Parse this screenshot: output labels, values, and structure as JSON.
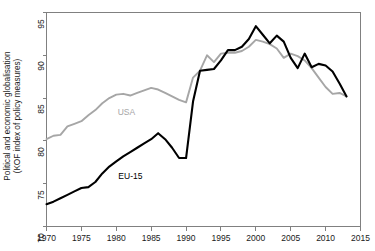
{
  "chart": {
    "ylabel_line1": "Political and economic globalisation",
    "ylabel_line2": "(KOF index of policy measures)",
    "ytick_labels": [
      "70",
      "75",
      "80",
      "85",
      "90",
      "95"
    ],
    "xtick_labels": [
      "1970",
      "1975",
      "1980",
      "1985",
      "1990",
      "1995",
      "2000",
      "2005",
      "2010",
      "2015"
    ],
    "series_label_usa": "USA",
    "series_label_eu": "EU-15",
    "color_usa": "#a6a6a6",
    "color_eu": "#000000",
    "color_axis": "#808080",
    "color_text": "#1a1a1a"
  },
  "chart_data": {
    "type": "line",
    "title": "",
    "xlabel": "",
    "ylabel": "Political and economic globalisation (KOF index of policy measures)",
    "xlim": [
      1970,
      2015
    ],
    "ylim": [
      70,
      95
    ],
    "xticks": [
      1970,
      1975,
      1980,
      1985,
      1990,
      1995,
      2000,
      2005,
      2010,
      2015
    ],
    "yticks": [
      70,
      75,
      80,
      85,
      90,
      95
    ],
    "grid": false,
    "legend": "inline-annotations",
    "x": [
      1970,
      1971,
      1972,
      1973,
      1974,
      1975,
      1976,
      1977,
      1978,
      1979,
      1980,
      1981,
      1982,
      1983,
      1984,
      1985,
      1986,
      1987,
      1988,
      1989,
      1990,
      1991,
      1992,
      1993,
      1994,
      1995,
      1996,
      1997,
      1998,
      1999,
      2000,
      2001,
      2002,
      2003,
      2004,
      2005,
      2006,
      2007,
      2008,
      2009,
      2010,
      2011,
      2012,
      2013
    ],
    "series": [
      {
        "name": "USA",
        "color": "#a6a6a6",
        "values": [
          80.2,
          80.6,
          80.7,
          81.7,
          82.0,
          82.3,
          83.0,
          83.6,
          84.4,
          85.0,
          85.4,
          85.5,
          85.3,
          85.6,
          85.9,
          86.2,
          86.0,
          85.6,
          85.2,
          84.8,
          84.5,
          87.4,
          88.2,
          90.0,
          89.2,
          90.2,
          90.3,
          90.3,
          90.5,
          91.0,
          91.8,
          91.6,
          91.3,
          90.8,
          89.7,
          90.2,
          89.9,
          89.4,
          88.5,
          87.4,
          86.3,
          85.5,
          85.6,
          85.2
        ]
      },
      {
        "name": "EU-15",
        "color": "#000000",
        "values": [
          72.6,
          72.9,
          73.3,
          73.7,
          74.1,
          74.5,
          74.6,
          75.2,
          76.2,
          77.0,
          77.6,
          78.2,
          78.7,
          79.2,
          79.7,
          80.2,
          80.9,
          80.2,
          79.2,
          78.0,
          78.0,
          84.6,
          88.2,
          88.3,
          88.4,
          89.4,
          90.6,
          90.6,
          91.0,
          91.9,
          93.4,
          92.4,
          91.4,
          92.3,
          91.6,
          89.7,
          88.5,
          90.2,
          88.6,
          89.0,
          88.8,
          88.1,
          86.7,
          85.2
        ]
      }
    ]
  }
}
